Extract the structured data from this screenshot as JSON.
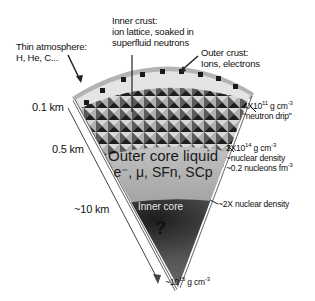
{
  "diagram": {
    "layers": {
      "atmosphere": {
        "label": "Thin atmosphere:",
        "sub": "H, He, C..."
      },
      "outer_crust": {
        "label": "Outer crust:",
        "sub": "Ions, electrons"
      },
      "inner_crust": {
        "line1": "Inner crust:",
        "line2": "ion lattice, soaked in",
        "line3": "superfluid neutrons"
      },
      "outer_core": {
        "line1": "Outer core liquid",
        "line2": "e⁻, μ, SFn, SCp"
      },
      "inner_core": {
        "label": "Inner core",
        "mark": "?"
      }
    },
    "depths": [
      {
        "label": "0.1 km"
      },
      {
        "label": "0.5 km"
      },
      {
        "label": "~10 km"
      }
    ],
    "densities": {
      "neutron_drip": {
        "base": "4X10",
        "exp": "11",
        "unit": " g cm",
        "unit_exp": "-3",
        "note": "\"neutron drip\""
      },
      "nuclear": {
        "base": "2X10",
        "exp": "14",
        "unit": " g cm",
        "unit_exp": "-3",
        "note1": "~nuclear density",
        "note2": "~0.2 nucleons fm",
        "note2_exp": "-3"
      },
      "inner_core_boundary": {
        "label": "~2X nuclear density"
      },
      "center": {
        "base": "~10",
        "exp": "15",
        "unit": " g cm",
        "unit_exp": "-3"
      }
    },
    "colors": {
      "atmosphere": "#b5b5b5",
      "outer_crust": "#dcdcdc",
      "inner_crust_dark": "#2a2a2a",
      "inner_crust_light": "#9a9a9a",
      "outer_core": "#a8a8a8",
      "inner_core": "#4a4a4a"
    }
  }
}
